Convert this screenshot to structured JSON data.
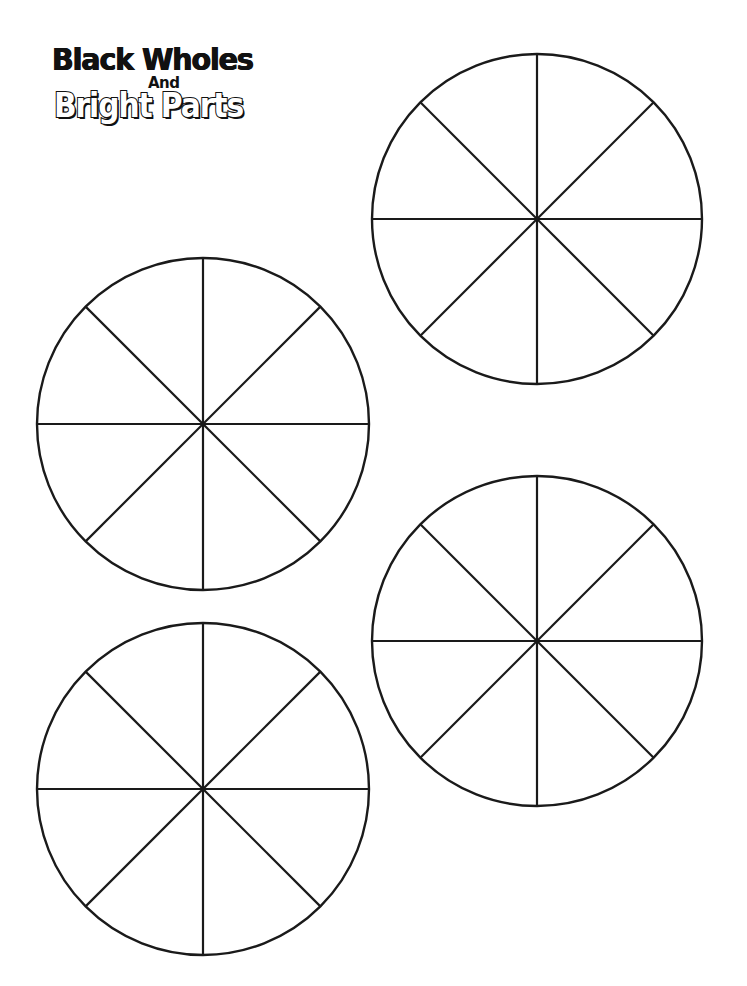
{
  "title": {
    "line1": "Black Wholes",
    "connector": "And",
    "line2": "Bright Parts"
  },
  "colors": {
    "background": "#ffffff",
    "stroke": "#1a1a1a"
  },
  "wheels": [
    {
      "name": "wheel-top-right",
      "cx": 537,
      "cy": 219,
      "r": 165,
      "segments": 8
    },
    {
      "name": "wheel-middle-left",
      "cx": 203,
      "cy": 424,
      "r": 166,
      "segments": 8
    },
    {
      "name": "wheel-lower-right",
      "cx": 537,
      "cy": 641,
      "r": 165,
      "segments": 8
    },
    {
      "name": "wheel-bottom-left",
      "cx": 203,
      "cy": 789,
      "r": 166,
      "segments": 8
    }
  ]
}
